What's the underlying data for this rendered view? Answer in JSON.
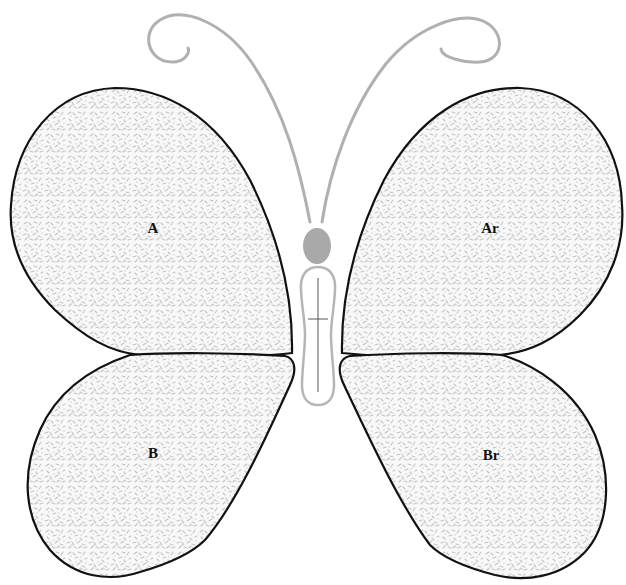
{
  "diagram": {
    "colors": {
      "wing_outline": "#111111",
      "wing_fill": "#f7f7f7",
      "wing_pattern": "#c2c2c2",
      "antenna": "#b0b0b0",
      "head": "#a9a9a9",
      "body_outline": "#b5b5b5",
      "body_line": "#555555"
    },
    "wings": [
      {
        "id": "upper-left",
        "label": "A",
        "x": 153,
        "y": 228
      },
      {
        "id": "upper-right",
        "label": "Ar",
        "x": 490,
        "y": 228
      },
      {
        "id": "lower-left",
        "label": "B",
        "x": 153,
        "y": 453
      },
      {
        "id": "lower-right",
        "label": "Br",
        "x": 491,
        "y": 455
      }
    ],
    "parts": [
      "left-antenna",
      "right-antenna",
      "head",
      "body"
    ]
  }
}
